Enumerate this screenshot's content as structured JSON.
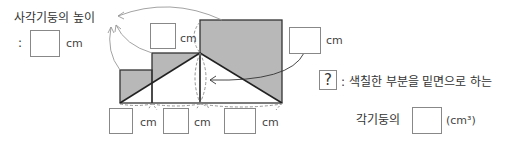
{
  "title_label": "사각기둥의 높이",
  "height_answer": {
    "prefix": ":",
    "unit": "cm"
  },
  "diagram_units": {
    "middle_height": "cm",
    "large_height": "cm",
    "bottom_1": "cm",
    "bottom_2": "cm",
    "bottom_3": "cm"
  },
  "question": {
    "mark": "?",
    "line1": ": 색칠한 부분을 밑면으로 하는",
    "line2": "각기둥의",
    "unit": "(cm³)"
  },
  "colors": {
    "shade": "#b8b8b8",
    "line": "#333333",
    "arrow": "#888888"
  }
}
